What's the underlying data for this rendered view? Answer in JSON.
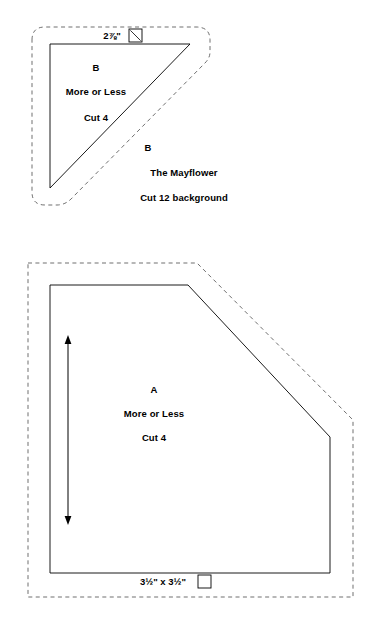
{
  "document": {
    "type": "quilt-pattern-template-sheet",
    "background_color": "#ffffff",
    "line_color": "#000000",
    "seam_line_color": "#555555"
  },
  "pieces": [
    {
      "id": "piece-b",
      "shape": "right-triangle",
      "letter": "B",
      "measurement": "2⅞\"",
      "measurement_icon": "square-with-diagonal-icon",
      "labels": {
        "letter_top": "B",
        "block_name_top": "More or Less",
        "cut_instruction_top": "Cut 4",
        "letter_bottom": "B",
        "block_name_bottom": "The Mayflower",
        "cut_instruction_bottom": "Cut 12 background"
      }
    },
    {
      "id": "piece-a",
      "shape": "beveled-square-pentagon",
      "letter": "A",
      "measurement": "3½\" x 3½\"",
      "measurement_icon": "square-icon",
      "grain_line": "vertical-double-arrow",
      "labels": {
        "letter": "A",
        "block_name": "More or Less",
        "cut_instruction": "Cut 4"
      }
    }
  ]
}
